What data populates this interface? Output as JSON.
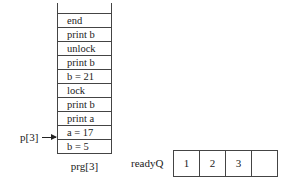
{
  "stack": {
    "label": "prg[3]",
    "cells": [
      "end",
      "print b",
      "unlock",
      "print b",
      "b = 21",
      "lock",
      "print b",
      "print a",
      "a = 17",
      "b = 5"
    ]
  },
  "pointer": {
    "label": "p[3]",
    "points_to_index": 8
  },
  "ready_queue": {
    "label": "readyQ",
    "cells": [
      "1",
      "2",
      "3",
      ""
    ]
  }
}
